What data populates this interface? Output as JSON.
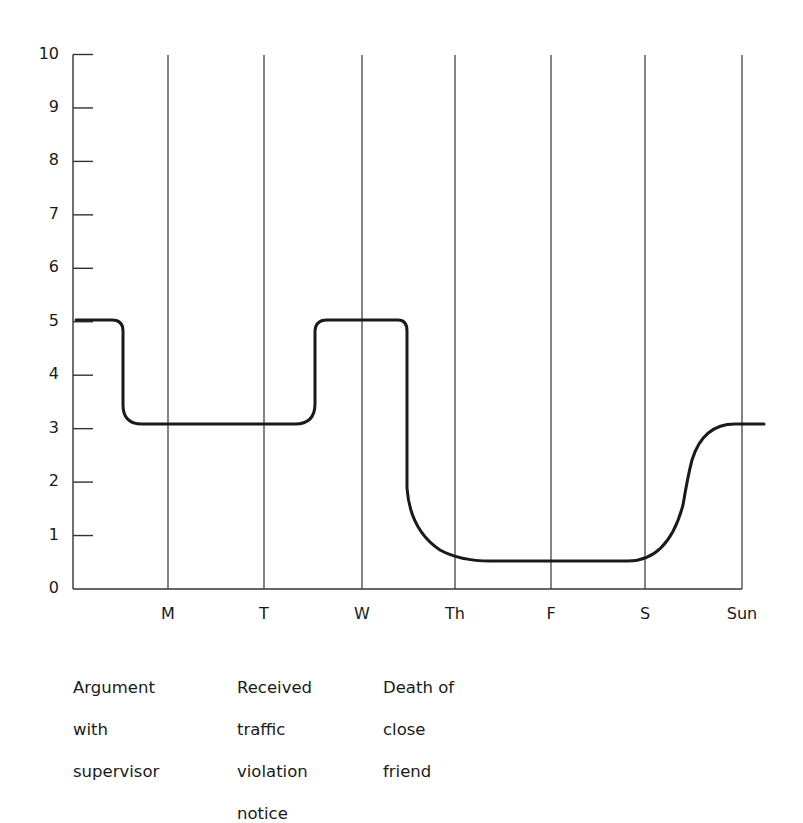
{
  "chart_data": {
    "type": "line",
    "title": "",
    "xlabel": "",
    "ylabel": "",
    "ylim": [
      0,
      10
    ],
    "yticks": [
      0,
      1,
      2,
      3,
      4,
      5,
      6,
      7,
      8,
      9,
      10
    ],
    "ytick_labels": [
      "0",
      "1",
      "2",
      "3",
      "4",
      "5",
      "6",
      "7",
      "8",
      "9",
      "10"
    ],
    "categories": [
      "M",
      "T",
      "W",
      "Th",
      "F",
      "S",
      "Sun"
    ],
    "grid": "vertical lines at each day",
    "series": [
      {
        "name": "Stress level",
        "color": "#1a1a1a",
        "description": "Starts at 5, drops to ~3.1 shortly before Monday after argument, stays ~3.1 through Tuesday, rises to 5 before Wednesday, stays 5 until after Wednesday, drops to ~0.5 by Thursday after death of friend, stays ~0.5 through Saturday, rises to ~3.1 by Sunday",
        "points": [
          {
            "x": "start",
            "y": 5.0
          },
          {
            "x": "before M",
            "y": 5.0
          },
          {
            "x": "before M (drop)",
            "y": 3.1
          },
          {
            "x": "M",
            "y": 3.1
          },
          {
            "x": "T",
            "y": 3.1
          },
          {
            "x": "between T and W (rise)",
            "y": 5.0
          },
          {
            "x": "W",
            "y": 5.0
          },
          {
            "x": "after W (drop)",
            "y": 1.8
          },
          {
            "x": "Th",
            "y": 0.6
          },
          {
            "x": "F",
            "y": 0.52
          },
          {
            "x": "S",
            "y": 0.55
          },
          {
            "x": "between S and Sun (rise)",
            "y": 2.0
          },
          {
            "x": "Sun",
            "y": 3.1
          },
          {
            "x": "end",
            "y": 3.1
          }
        ]
      }
    ],
    "annotations": [
      {
        "lines": [
          "Argument",
          "with",
          "supervisor"
        ]
      },
      {
        "lines": [
          "Received",
          "traffic",
          "violation",
          "notice"
        ]
      },
      {
        "lines": [
          "Death of",
          "close",
          "friend"
        ]
      }
    ]
  },
  "layout": {
    "axis_x": 73,
    "axis_y0": 589,
    "axis_y10": 54.5,
    "grid_top": 55,
    "day_x": [
      168,
      264,
      362,
      455,
      551,
      645,
      742
    ],
    "curve_path": "M 76 320 L 112 320 Q 123 320 123 331 L 123 405 Q 123 424 142 424 L 295 424 Q 315 424 315 404 L 315 332 Q 315 320 327 320 L 398 320 Q 407 320 407 331 L 407 488 Q 410 530 440 550 Q 460 561 490 561 L 628 561 Q 668 561 683 505 Q 688 475 692 460 Q 703 424 735 424 L 764 424",
    "colors": {
      "line": "#1a1a1a",
      "axis": "#333333",
      "grid": "#333333",
      "background": "#ffffff"
    }
  }
}
